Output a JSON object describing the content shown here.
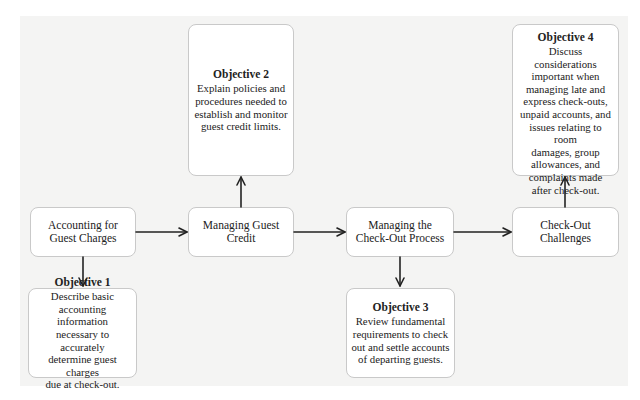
{
  "diagram": {
    "process": [
      {
        "id": "accounting",
        "label_line1": "Accounting for",
        "label_line2": "Guest Charges"
      },
      {
        "id": "credit",
        "label_line1": "Managing Guest",
        "label_line2": "Credit"
      },
      {
        "id": "checkout",
        "label_line1": "Managing the",
        "label_line2": "Check-Out Process"
      },
      {
        "id": "challenges",
        "label_line1": "Check-Out",
        "label_line2": "Challenges"
      }
    ],
    "objectives": [
      {
        "title": "Objective 1",
        "lines": [
          "Describe basic",
          "accounting information",
          "necessary to accurately",
          "determine guest charges",
          "due at check-out."
        ]
      },
      {
        "title": "Objective 2",
        "lines": [
          "Explain policies and",
          "procedures needed to",
          "establish and monitor",
          "guest credit limits."
        ]
      },
      {
        "title": "Objective 3",
        "lines": [
          "Review fundamental",
          "requirements to check",
          "out and settle accounts",
          "of departing guests."
        ]
      },
      {
        "title": "Objective 4",
        "lines": [
          "Discuss considerations",
          "important when",
          "managing late and",
          "express check-outs,",
          "unpaid accounts, and",
          "issues relating to room",
          "damages, group",
          "allowances, and",
          "complaints made",
          "after check-out."
        ]
      }
    ],
    "colors": {
      "panel_background": "#f4f4f3",
      "box_background": "#ffffff",
      "box_border": "#c9c9c9",
      "arrow": "#222222",
      "text": "#222222"
    }
  }
}
